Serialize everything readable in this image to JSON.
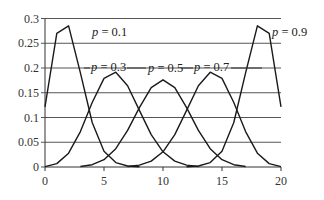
{
  "chart_data": {
    "type": "line",
    "title": "",
    "xlabel": "",
    "ylabel": "",
    "xlim": [
      0,
      20
    ],
    "ylim": [
      0,
      0.3
    ],
    "x_ticks": [
      0,
      5,
      10,
      15,
      20
    ],
    "x_tick_labels": [
      "0",
      "5",
      "10",
      "15",
      "20"
    ],
    "y_ticks": [
      0,
      0.05,
      0.1,
      0.15,
      0.2,
      0.25,
      0.3
    ],
    "y_tick_labels": [
      "0",
      "0.05",
      "0.1",
      "0.15",
      "0.2",
      "0.25",
      "0.3"
    ],
    "grid": "horizontal",
    "legend": "inline labels",
    "series": [
      {
        "name": "p = 0.1",
        "label_var": "p",
        "label_val": "= 0.1",
        "x": [
          0,
          1,
          2,
          3,
          4,
          5,
          6,
          7,
          8
        ],
        "values": [
          0.1216,
          0.2702,
          0.2852,
          0.1901,
          0.0898,
          0.0319,
          0.0089,
          0.002,
          0.0004
        ]
      },
      {
        "name": "p = 0.3",
        "label_var": "p",
        "label_val": "= 0.3",
        "x": [
          0,
          1,
          2,
          3,
          4,
          5,
          6,
          7,
          8,
          9,
          10,
          11,
          12,
          13
        ],
        "values": [
          0.0008,
          0.0068,
          0.0278,
          0.0716,
          0.1304,
          0.1789,
          0.1916,
          0.1643,
          0.1144,
          0.0654,
          0.0308,
          0.012,
          0.0039,
          0.001
        ]
      },
      {
        "name": "p = 0.5",
        "label_var": "p",
        "label_val": "= 0.5",
        "x": [
          3,
          4,
          5,
          6,
          7,
          8,
          9,
          10,
          11,
          12,
          13,
          14,
          15,
          16,
          17
        ],
        "values": [
          0.0011,
          0.0046,
          0.0148,
          0.037,
          0.0739,
          0.1201,
          0.1602,
          0.1762,
          0.1602,
          0.1201,
          0.0739,
          0.037,
          0.0148,
          0.0046,
          0.0011
        ]
      },
      {
        "name": "p = 0.7",
        "label_var": "p",
        "label_val": "= 0.7",
        "x": [
          7,
          8,
          9,
          10,
          11,
          12,
          13,
          14,
          15,
          16,
          17,
          18,
          19,
          20
        ],
        "values": [
          0.001,
          0.0039,
          0.012,
          0.0308,
          0.0654,
          0.1144,
          0.1643,
          0.1916,
          0.1789,
          0.1304,
          0.0716,
          0.0278,
          0.0068,
          0.0008
        ]
      },
      {
        "name": "p = 0.9",
        "label_var": "p",
        "label_val": "= 0.9",
        "x": [
          12,
          13,
          14,
          15,
          16,
          17,
          18,
          19,
          20
        ],
        "values": [
          0.0004,
          0.002,
          0.0089,
          0.0319,
          0.0898,
          0.1901,
          0.2852,
          0.2702,
          0.1216
        ]
      }
    ],
    "colors": {
      "line": "#1a1a1a",
      "grid": "#555555",
      "text": "#333333"
    }
  }
}
